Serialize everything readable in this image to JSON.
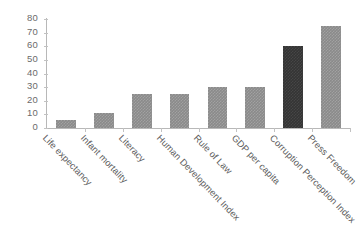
{
  "chart_data": {
    "type": "bar",
    "title": "",
    "subtitle": "",
    "xlabel": "",
    "ylabel": "",
    "ylim": [
      0,
      80
    ],
    "ytick_step": 10,
    "yticks": [
      0,
      10,
      20,
      30,
      40,
      50,
      60,
      70,
      80
    ],
    "grid": false,
    "legend": null,
    "xlabel_rotation_deg": 46,
    "categories": [
      "Life expectancy",
      "Infant mortality",
      "Literacy",
      "Human Development Index",
      "Rule of Law",
      "GDP per capita",
      "Corruption Perception Index",
      "Press Freedom"
    ],
    "values": [
      6,
      11,
      25,
      25,
      30,
      30,
      60,
      75
    ],
    "bar_colors": [
      "#8a8a8a",
      "#8a8a8a",
      "#8a8a8a",
      "#8a8a8a",
      "#8a8a8a",
      "#8a8a8a",
      "#343434",
      "#8a8a8a"
    ],
    "highlighted_category": "Corruption Perception Index",
    "axis_color": "#b8b8b8",
    "tick_label_color": "#6b6b6b",
    "background": "#ffffff"
  }
}
